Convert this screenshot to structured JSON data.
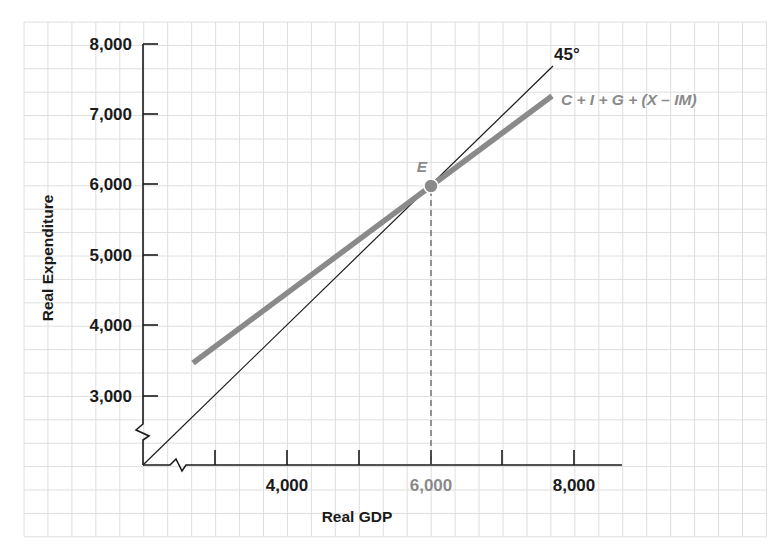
{
  "chart_data": {
    "type": "line",
    "title": "",
    "xlabel": "Real GDP",
    "ylabel": "Real Expenditure",
    "x_ticks": [
      3000,
      4000,
      5000,
      6000,
      7000,
      8000
    ],
    "x_tick_labels": [
      "4,000",
      "6,000",
      "8,000"
    ],
    "y_ticks": [
      3000,
      4000,
      5000,
      6000,
      7000,
      8000
    ],
    "y_tick_labels": [
      "3,000",
      "4,000",
      "5,000",
      "6,000",
      "7,000",
      "8,000"
    ],
    "xlim": [
      2000,
      8600
    ],
    "ylim": [
      2000,
      8300
    ],
    "axis_breaks": true,
    "grid": true,
    "series": [
      {
        "name": "45°",
        "style": "thin black line",
        "color": "#1a1a1a",
        "x": [
          2000,
          7700
        ],
        "y": [
          2000,
          7700
        ]
      },
      {
        "name": "C + I + G + (X – IM)",
        "style": "thick gray line",
        "color": "#8a8a8a",
        "x": [
          2700,
          7700
        ],
        "y": [
          3450,
          7300
        ]
      }
    ],
    "annotations": [
      {
        "label": "E",
        "x": 6000,
        "y": 6000,
        "type": "equilibrium point",
        "color": "#8a8a8a"
      },
      {
        "type": "dashed vertical line",
        "x": 6000,
        "from_y": 2000,
        "to_y": 6000
      },
      {
        "label": "6,000",
        "type": "highlighted x tick label",
        "color": "#8a8a8a"
      }
    ]
  },
  "labels": {
    "y_axis_title": "Real Expenditure",
    "x_axis_title": "Real GDP",
    "line_45": "45°",
    "ae_line": "C + I + G + (X – IM)",
    "point_e": "E",
    "y3": "3,000",
    "y4": "4,000",
    "y5": "5,000",
    "y6": "6,000",
    "y7": "7,000",
    "y8": "8,000",
    "x4": "4,000",
    "x6": "6,000",
    "x8": "8,000"
  },
  "colors": {
    "axis": "#1a1a1a",
    "grid": "#dcdcdc",
    "ae_line": "#8a8a8a",
    "highlight": "#8a8a8a"
  }
}
